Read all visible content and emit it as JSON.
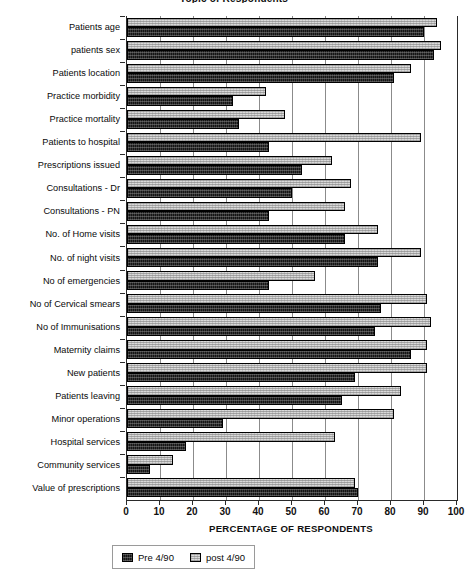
{
  "chart_data": {
    "type": "bar",
    "orientation": "horizontal",
    "title": "Topic of Respondents",
    "xlabel": "PERCENTAGE OF RESPONDENTS",
    "ylabel": "",
    "xlim": [
      0,
      100
    ],
    "xticks": [
      0,
      10,
      20,
      30,
      40,
      50,
      60,
      70,
      80,
      90,
      100
    ],
    "grid": "vertical",
    "legend_position": "bottom-left",
    "categories": [
      "Patients age",
      "patients sex",
      "Patients location",
      "Practice morbidity",
      "Practice mortality",
      "Patients to hospital",
      "Prescriptions issued",
      "Consultations - Dr",
      "Consultations - PN",
      "No. of Home visits",
      "No. of night visits",
      "No of emergencies",
      "No of Cervical smears",
      "No of Immunisations",
      "Maternity claims",
      "New patients",
      "Patients leaving",
      "Minor operations",
      "Hospital services",
      "Community services",
      "Value of prescriptions"
    ],
    "series": [
      {
        "name": "Pre 4/90",
        "color": "#151515",
        "values": [
          90,
          93,
          81,
          32,
          34,
          43,
          53,
          50,
          43,
          66,
          76,
          43,
          77,
          75,
          86,
          69,
          65,
          29,
          18,
          7,
          70
        ]
      },
      {
        "name": "post 4/90",
        "color": "#d9d9d9",
        "values": [
          94,
          95,
          86,
          42,
          48,
          89,
          62,
          68,
          66,
          76,
          89,
          57,
          91,
          92,
          91,
          91,
          83,
          81,
          63,
          14,
          69
        ]
      }
    ]
  },
  "axis": {
    "x_title": "PERCENTAGE OF RESPONDENTS",
    "tick_labels": [
      "0",
      "10",
      "20",
      "30",
      "40",
      "50",
      "60",
      "70",
      "80",
      "90",
      "100"
    ]
  },
  "legend": {
    "items": [
      {
        "label": "Pre 4/90",
        "swatch": "dark-hatched"
      },
      {
        "label": "post 4/90",
        "swatch": "light-hatched"
      }
    ]
  }
}
